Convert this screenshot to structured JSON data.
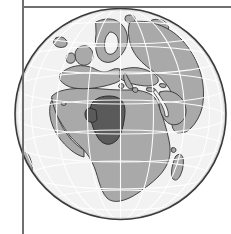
{
  "figure": {
    "type": "locator-globe-map",
    "projection": "orthographic",
    "title": "",
    "caption": "",
    "center_lon": 10,
    "center_lat": 12,
    "highlighted_region": "Niger",
    "globe": {
      "cx": 120.5,
      "cy": 114,
      "r": 106,
      "outline_color": "#3a3a3a",
      "ocean_color": "#f2f2f2",
      "land_color": "#a9a9a9",
      "highlight_color": "#5a5a5a",
      "coastline_color": "#333333",
      "graticule_color": "#ffffff",
      "graticule_spacing_deg": 20
    },
    "frame": {
      "rule_color": "#6f6f6f",
      "vertical_rule_x": 22,
      "horizontal_rule_y": 6
    },
    "landmasses": [
      "Africa",
      "Europe",
      "Scandinavia",
      "Iceland",
      "Greenland edge",
      "Arabian Peninsula",
      "Middle East",
      "Madagascar",
      "South America edge"
    ],
    "labels": []
  },
  "chart_data": {
    "type": "map",
    "title": "",
    "projection": "orthographic",
    "center": [
      10,
      12
    ],
    "highlight": {
      "name": "Niger",
      "color": "#5a5a5a"
    },
    "categories": [
      "ocean",
      "land",
      "highlight"
    ],
    "values": [
      null,
      null,
      null
    ],
    "legend": [],
    "xlabel": "",
    "ylabel": ""
  }
}
